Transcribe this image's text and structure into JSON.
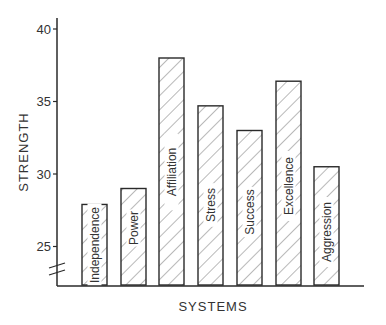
{
  "chart_data": {
    "type": "bar",
    "title": "",
    "xlabel": "SYSTEMS",
    "ylabel": "STRENGTH",
    "categories": [
      "Independence",
      "Power",
      "Affiliation",
      "Stress",
      "Success",
      "Excellence",
      "Aggression"
    ],
    "values": [
      27.9,
      29.0,
      38.0,
      34.7,
      33.0,
      36.4,
      30.5
    ],
    "yticks": [
      25,
      30,
      35,
      40
    ],
    "ylim": [
      23.5,
      40.8
    ],
    "axis_break": true,
    "grid": false,
    "legend": null,
    "bar_fill": "diagonal-hatch",
    "labels_inside_bars": true,
    "colors": {
      "stroke": "#2a2a2a",
      "hatch": "#8a8a8a",
      "background": "#ffffff"
    }
  }
}
